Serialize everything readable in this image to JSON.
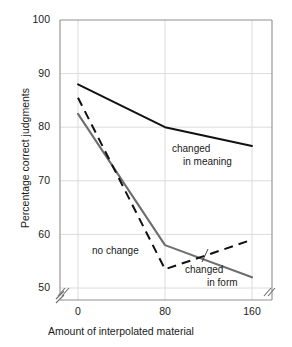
{
  "figure": {
    "background": "#ffffff",
    "frame_color": "#9a9a9a",
    "grid_color": "#d8d8d8"
  },
  "chart_data": {
    "type": "line",
    "title": "",
    "xlabel": "Amount of interpolated material",
    "ylabel": "Percentage correct judgments",
    "x": [
      0,
      80,
      160
    ],
    "xticklabels": [
      "0",
      "80",
      "160"
    ],
    "yticklabels": [
      "50",
      "60",
      "70",
      "80",
      "90",
      "100"
    ],
    "xlim": [
      0,
      160
    ],
    "ylim": [
      50,
      100
    ],
    "grid": true,
    "legend_position": "inline-annotations",
    "axis_break_y": true,
    "axis_break_x_left": true,
    "axis_break_x_right": true,
    "series": [
      {
        "name": "changed in meaning",
        "values": [
          88,
          80,
          76.5
        ],
        "color": "#111111",
        "style": "solid",
        "width": 1.9,
        "label_line1": "changed",
        "label_line2": "in meaning"
      },
      {
        "name": "no change",
        "values": [
          85.5,
          53.5,
          59
        ],
        "color": "#111111",
        "style": "dashed",
        "width": 2.0,
        "label_line1": "no change",
        "label_line2": ""
      },
      {
        "name": "changed in form",
        "values": [
          82.5,
          58,
          52
        ],
        "color": "#6e6e6e",
        "style": "solid",
        "width": 2.1,
        "label_line1": "changed",
        "label_line2": "in form"
      }
    ]
  },
  "axes": {
    "y_ticks": [
      {
        "label": "100",
        "top": 14
      },
      {
        "label": "90",
        "top": 68
      },
      {
        "label": "80",
        "top": 121
      },
      {
        "label": "70",
        "top": 174
      },
      {
        "label": "60",
        "top": 228
      },
      {
        "label": "50",
        "top": 281
      }
    ],
    "x_ticks": [
      {
        "label": "0",
        "left": 78
      },
      {
        "label": "80",
        "left": 165
      },
      {
        "label": "160",
        "left": 252
      }
    ]
  }
}
